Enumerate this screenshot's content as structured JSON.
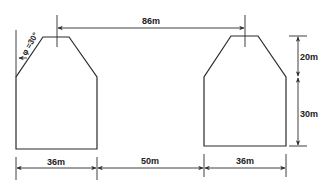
{
  "diagram": {
    "type": "engineering-dimension-drawing",
    "shapes": [
      {
        "name": "left-building",
        "description": "pentagonal profile with chamfered top"
      },
      {
        "name": "right-building",
        "description": "pentagonal profile with chamfered top"
      }
    ],
    "dimensions": {
      "center_spacing": "86m",
      "left_width": "36m",
      "gap": "50m",
      "right_width": "36m",
      "upper_height": "20m",
      "lower_height": "30m",
      "angle": "φ =30°"
    },
    "colors": {
      "line": "#2a2a2a",
      "background": "#ffffff"
    }
  }
}
